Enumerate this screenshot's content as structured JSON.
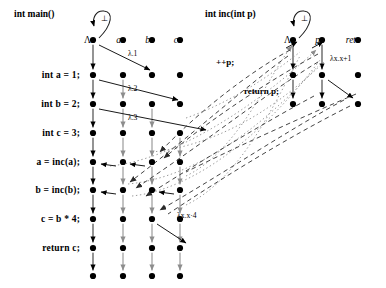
{
  "figure": {
    "type": "program-dependence-demand-graph",
    "width": 386,
    "height": 288,
    "bg": "#ffffff",
    "ink": "#000000",
    "grey": "#9a9a9a"
  },
  "panels": [
    {
      "id": "main",
      "title": "int main()",
      "title_x": 14,
      "title_y": 14
    },
    {
      "id": "inc",
      "title": "int inc(int p)",
      "title_x": 205,
      "title_y": 14
    }
  ],
  "code_lines": [
    {
      "text": "int main()",
      "row": 0
    },
    {
      "text": "int a = 1;",
      "row": 1
    },
    {
      "text": "int b = 2;",
      "row": 2
    },
    {
      "text": "int c = 3;",
      "row": 3
    },
    {
      "text": "a = inc(a);",
      "row": 4
    },
    {
      "text": "b = inc(b);",
      "row": 5
    },
    {
      "text": "c = b * 4;",
      "row": 6
    },
    {
      "text": "return c;",
      "row": 7
    }
  ],
  "rows_y": [
    40,
    75,
    104,
    133,
    162,
    190,
    219,
    248,
    276
  ],
  "columns_main": [
    {
      "name": "lambda",
      "label": "Λ",
      "x": 93,
      "italic": false
    },
    {
      "name": "a",
      "label": "a",
      "x": 123,
      "italic": true
    },
    {
      "name": "b",
      "label": "b",
      "x": 152,
      "italic": true
    },
    {
      "name": "c",
      "label": "c",
      "x": 180,
      "italic": true
    }
  ],
  "columns_inc": [
    {
      "name": "lambda",
      "label": "Λ",
      "x": 293,
      "italic": false
    },
    {
      "name": "p",
      "label": "p",
      "x": 322,
      "italic": true
    },
    {
      "name": "ret",
      "label": "ret",
      "x": 358,
      "italic": true
    }
  ],
  "self_loops": [
    {
      "at_col": "main-lambda",
      "x": 93,
      "y": 40,
      "label": "⊥"
    },
    {
      "at_col": "inc-lambda",
      "x": 293,
      "y": 40,
      "label": "⊥"
    }
  ],
  "edge_labels": [
    {
      "text": "λ.1",
      "x": 128,
      "y": 53,
      "style": "plain"
    },
    {
      "text": "λ.2",
      "x": 128,
      "y": 88,
      "style": "plain"
    },
    {
      "text": "λ.3",
      "x": 128,
      "y": 117,
      "style": "plain"
    },
    {
      "text": "λx.x·4",
      "x": 177,
      "y": 215,
      "style": "plain"
    },
    {
      "text": "λx.x+1",
      "x": 330,
      "y": 58,
      "style": "plain"
    },
    {
      "text": "++p;",
      "x": 216,
      "y": 62,
      "style": "bold"
    },
    {
      "text": "return p;",
      "x": 244,
      "y": 91,
      "style": "bold"
    }
  ],
  "legend_note": "solid = intra-procedural flow, dashed = call/return, dotted = cross-procedure demand"
}
